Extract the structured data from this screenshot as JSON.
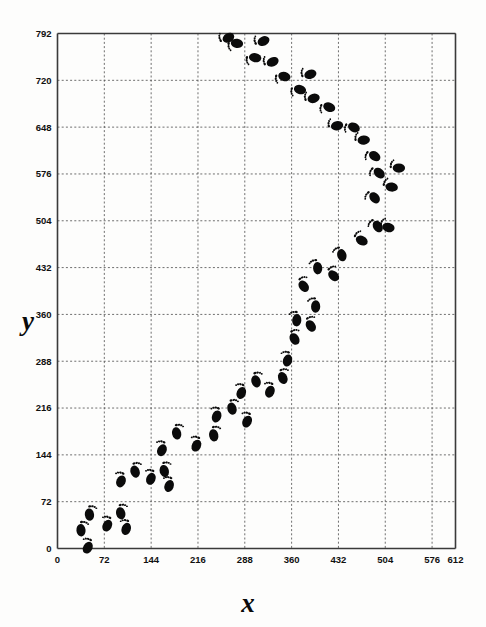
{
  "figure": {
    "background_color": "#fdfdfc",
    "ink_color": "#0b0b0b",
    "grid_color": "#555555",
    "frame_color": "#3a3a3a"
  },
  "axes": {
    "x_title": "x",
    "y_title": "y",
    "x_ticks": [
      "0",
      "72",
      "144",
      "216",
      "288",
      "360",
      "432",
      "504",
      "576",
      "612"
    ],
    "y_ticks": [
      "0",
      "72",
      "144",
      "216",
      "288",
      "360",
      "432",
      "504",
      "576",
      "648",
      "720",
      "792"
    ]
  },
  "chart_data": {
    "type": "scatter",
    "title": "",
    "xlabel": "x",
    "ylabel": "y",
    "xlim": [
      0,
      612
    ],
    "ylim": [
      0,
      792
    ],
    "grid": true,
    "legend": "none",
    "marker": "footprint",
    "xticks": [
      0,
      72,
      144,
      216,
      288,
      360,
      432,
      504,
      576,
      612
    ],
    "yticks": [
      0,
      72,
      144,
      216,
      288,
      360,
      432,
      504,
      576,
      648,
      720,
      792
    ],
    "series": [
      {
        "name": "footprint trail",
        "points": [
          {
            "x": 36,
            "y": 29,
            "foot": "left",
            "angle": 38
          },
          {
            "x": 47,
            "y": 2,
            "foot": "right",
            "angle": 38
          },
          {
            "x": 49,
            "y": 53,
            "foot": "left",
            "angle": 40
          },
          {
            "x": 77,
            "y": 36,
            "foot": "right",
            "angle": 40
          },
          {
            "x": 97,
            "y": 55,
            "foot": "left",
            "angle": 46
          },
          {
            "x": 106,
            "y": 31,
            "foot": "right",
            "angle": 48
          },
          {
            "x": 98,
            "y": 104,
            "foot": "right",
            "angle": 44
          },
          {
            "x": 119,
            "y": 119,
            "foot": "left",
            "angle": 50
          },
          {
            "x": 144,
            "y": 108,
            "foot": "right",
            "angle": 44
          },
          {
            "x": 164,
            "y": 120,
            "foot": "left",
            "angle": 46
          },
          {
            "x": 172,
            "y": 97,
            "foot": "right",
            "angle": 46
          },
          {
            "x": 161,
            "y": 152,
            "foot": "right",
            "angle": 44
          },
          {
            "x": 183,
            "y": 178,
            "foot": "left",
            "angle": 44
          },
          {
            "x": 214,
            "y": 159,
            "foot": "right",
            "angle": 42
          },
          {
            "x": 240,
            "y": 175,
            "foot": "left",
            "angle": 44
          },
          {
            "x": 245,
            "y": 204,
            "foot": "right",
            "angle": 46
          },
          {
            "x": 268,
            "y": 216,
            "foot": "left",
            "angle": 48
          },
          {
            "x": 292,
            "y": 196,
            "foot": "right",
            "angle": 42
          },
          {
            "x": 283,
            "y": 240,
            "foot": "right",
            "angle": 46
          },
          {
            "x": 305,
            "y": 258,
            "foot": "left",
            "angle": 50
          },
          {
            "x": 327,
            "y": 242,
            "foot": "right",
            "angle": 44
          },
          {
            "x": 346,
            "y": 263,
            "foot": "left",
            "angle": 54
          },
          {
            "x": 354,
            "y": 290,
            "foot": "right",
            "angle": 52
          },
          {
            "x": 364,
            "y": 323,
            "foot": "left",
            "angle": 62
          },
          {
            "x": 368,
            "y": 352,
            "foot": "right",
            "angle": 62
          },
          {
            "x": 389,
            "y": 343,
            "foot": "left",
            "angle": 66
          },
          {
            "x": 397,
            "y": 373,
            "foot": "right",
            "angle": 66
          },
          {
            "x": 378,
            "y": 404,
            "foot": "left",
            "angle": 70
          },
          {
            "x": 400,
            "y": 432,
            "foot": "right",
            "angle": 72
          },
          {
            "x": 424,
            "y": 420,
            "foot": "left",
            "angle": 78
          },
          {
            "x": 437,
            "y": 452,
            "foot": "right",
            "angle": 82
          },
          {
            "x": 467,
            "y": 474,
            "foot": "left",
            "angle": 96
          },
          {
            "x": 492,
            "y": 496,
            "foot": "right",
            "angle": 100
          },
          {
            "x": 508,
            "y": 494,
            "foot": "left",
            "angle": 108
          },
          {
            "x": 487,
            "y": 540,
            "foot": "right",
            "angle": 108
          },
          {
            "x": 513,
            "y": 556,
            "foot": "left",
            "angle": 114
          },
          {
            "x": 494,
            "y": 578,
            "foot": "right",
            "angle": 116
          },
          {
            "x": 524,
            "y": 585,
            "foot": "left",
            "angle": 122
          },
          {
            "x": 487,
            "y": 604,
            "foot": "right",
            "angle": 122
          },
          {
            "x": 470,
            "y": 628,
            "foot": "left",
            "angle": 128
          },
          {
            "x": 455,
            "y": 648,
            "foot": "right",
            "angle": 130
          },
          {
            "x": 429,
            "y": 650,
            "foot": "left",
            "angle": 134
          },
          {
            "x": 417,
            "y": 679,
            "foot": "right",
            "angle": 136
          },
          {
            "x": 393,
            "y": 692,
            "foot": "left",
            "angle": 140
          },
          {
            "x": 372,
            "y": 706,
            "foot": "right",
            "angle": 142
          },
          {
            "x": 388,
            "y": 729,
            "foot": "left",
            "angle": 142
          },
          {
            "x": 348,
            "y": 726,
            "foot": "right",
            "angle": 144
          },
          {
            "x": 330,
            "y": 748,
            "foot": "left",
            "angle": 146
          },
          {
            "x": 303,
            "y": 755,
            "foot": "right",
            "angle": 148
          },
          {
            "x": 316,
            "y": 780,
            "foot": "left",
            "angle": 148
          },
          {
            "x": 275,
            "y": 777,
            "foot": "right",
            "angle": 150
          },
          {
            "x": 262,
            "y": 785,
            "foot": "left",
            "angle": 152
          }
        ]
      }
    ]
  }
}
